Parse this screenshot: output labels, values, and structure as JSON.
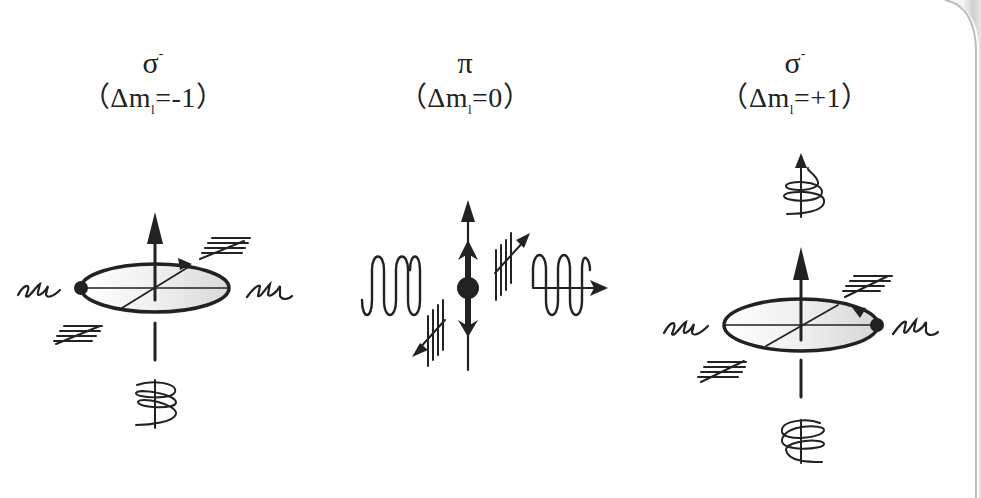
{
  "figure": {
    "panels": [
      {
        "id": "sigma-minus",
        "symbol": "σ",
        "symbol_superscript": "-",
        "eq_open": "（Δm",
        "eq_sub": "l",
        "eq_rest": "=-1）",
        "description": "Circular polarization; electron rotates around upward magnetic field axis; helical wave shown below"
      },
      {
        "id": "pi",
        "symbol": "π",
        "symbol_superscript": "",
        "eq_open": "（Δm",
        "eq_sub": "l",
        "eq_rest": "=0）",
        "description": "Linear polarization; electron oscillates along field axis; linear waves emitted sideways"
      },
      {
        "id": "sigma-plus",
        "symbol": "σ",
        "symbol_superscript": "-",
        "eq_open": "（Δm",
        "eq_sub": "l",
        "eq_rest": "=+1）",
        "description": "Circular polarization with opposite rotation; helical waves shown above and below"
      }
    ]
  },
  "colors": {
    "ink": "#222222",
    "disk_fill_light": "#f4f4f4",
    "disk_fill_dark": "#d6d6d6",
    "page_shadow": "#c8c8c8"
  }
}
